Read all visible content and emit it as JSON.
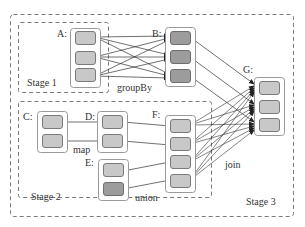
{
  "colors": {
    "background": "#ffffff",
    "dashed_border": "#7a7a7a",
    "container_border": "#9a9a9a",
    "light_partition": "#c8c8c8",
    "dark_partition": "#9c9c9c",
    "partition_border": "#7a7a7a",
    "edge": "#333333",
    "text": "#333333"
  },
  "stages": [
    {
      "id": "stage1",
      "label": "Stage 1"
    },
    {
      "id": "stage2",
      "label": "Stage 2"
    },
    {
      "id": "stage3",
      "label": "Stage 3"
    }
  ],
  "rdds": [
    {
      "id": "A",
      "label": "A:",
      "partitions": [
        "light",
        "light",
        "light"
      ]
    },
    {
      "id": "B",
      "label": "B:",
      "partitions": [
        "dark",
        "dark",
        "dark"
      ]
    },
    {
      "id": "C",
      "label": "C:",
      "partitions": [
        "light",
        "light"
      ]
    },
    {
      "id": "D",
      "label": "D:",
      "partitions": [
        "light",
        "light"
      ]
    },
    {
      "id": "E",
      "label": "E:",
      "partitions": [
        "light",
        "dark"
      ]
    },
    {
      "id": "F",
      "label": "F:",
      "partitions": [
        "light",
        "light",
        "light",
        "light"
      ]
    },
    {
      "id": "G",
      "label": "G:",
      "partitions": [
        "light",
        "light",
        "light"
      ]
    }
  ],
  "operations": [
    {
      "id": "groupBy",
      "label": "groupBy",
      "from": "A",
      "to": "B",
      "type": "wide"
    },
    {
      "id": "map",
      "label": "map",
      "from": "C",
      "to": "D",
      "type": "narrow"
    },
    {
      "id": "union",
      "label": "union",
      "from": [
        "D",
        "E"
      ],
      "to": "F",
      "type": "narrow"
    },
    {
      "id": "join",
      "label": "join",
      "from": [
        "B",
        "F"
      ],
      "to": "G",
      "type": "wide"
    }
  ]
}
